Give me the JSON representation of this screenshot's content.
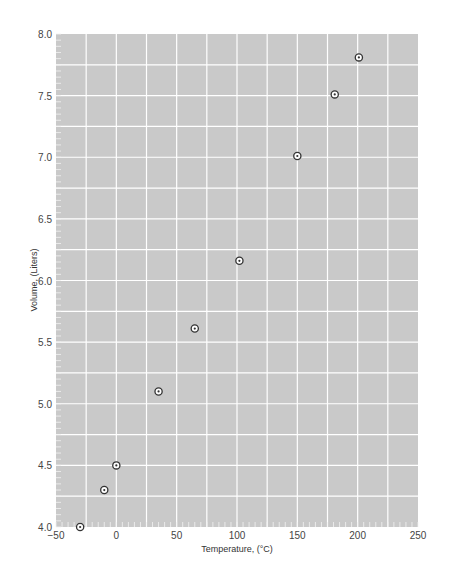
{
  "chart_data": {
    "type": "scatter",
    "title": "",
    "xlabel": "Temperature, (°C)",
    "ylabel": "Volume, (Liters)",
    "xlim": [
      -50,
      250
    ],
    "ylim": [
      4.0,
      8.0
    ],
    "x_ticks": [
      -50,
      0,
      50,
      100,
      150,
      200,
      250
    ],
    "x_tick_labels": [
      "−50",
      "0",
      "50",
      "100",
      "150",
      "200",
      "250"
    ],
    "y_ticks": [
      4.0,
      4.5,
      5.0,
      5.5,
      6.0,
      6.5,
      7.0,
      7.5,
      8.0
    ],
    "y_tick_labels": [
      "4.0",
      "4.5",
      "5.0",
      "5.5",
      "6.0",
      "6.5",
      "7.0",
      "7.5",
      "8.0"
    ],
    "grid": true,
    "x_minor_grid_step": 25,
    "y_minor_grid_step": 0.25,
    "legend": null,
    "series": [
      {
        "name": "Volume vs Temperature",
        "marker": "circle-dot",
        "x": [
          -30,
          -10,
          0,
          35,
          65,
          102,
          150,
          181,
          201
        ],
        "y": [
          4.0,
          4.3,
          4.5,
          5.1,
          5.61,
          6.16,
          7.01,
          7.51,
          7.81
        ]
      }
    ]
  },
  "colors": {
    "plot_background": "#c9c9c9",
    "grid_line": "#ffffff",
    "marker_ring": "#333333",
    "marker_fill": "#ffffff",
    "text": "#444444"
  }
}
